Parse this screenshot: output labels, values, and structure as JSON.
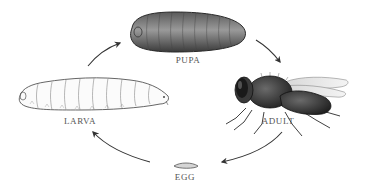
{
  "diagram": {
    "type": "life-cycle",
    "stages": [
      {
        "id": "pupa",
        "label": "PUPA",
        "icon": "pupa-icon"
      },
      {
        "id": "adult",
        "label": "ADULT",
        "icon": "adult-fly-icon"
      },
      {
        "id": "egg",
        "label": "EGG",
        "icon": "egg-icon"
      },
      {
        "id": "larva",
        "label": "LARVA",
        "icon": "larva-icon"
      }
    ],
    "arrows": [
      {
        "from": "larva",
        "to": "pupa"
      },
      {
        "from": "pupa",
        "to": "adult"
      },
      {
        "from": "adult",
        "to": "egg"
      },
      {
        "from": "egg",
        "to": "larva"
      }
    ],
    "colors": {
      "background": "#ffffff",
      "ink": "#333333",
      "label": "#555555"
    }
  }
}
